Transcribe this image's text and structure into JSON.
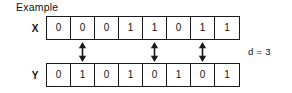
{
  "figure": {
    "caption": "Example",
    "distance_label": "d = 3",
    "rows": [
      {
        "name": "X",
        "label": "X",
        "bits": [
          "0",
          "0",
          "0",
          "1",
          "1",
          "0",
          "1",
          "1"
        ]
      },
      {
        "name": "Y",
        "label": "Y",
        "bits": [
          "0",
          "1",
          "0",
          "1",
          "0",
          "1",
          "0",
          "1"
        ]
      }
    ],
    "mismatch_indices": [
      1,
      4,
      6
    ],
    "arrow_icon": "double-headed-vertical-arrow-icon",
    "colors": {
      "stroke": "#1a1a1a",
      "text": "#111111",
      "background": "#ffffff"
    }
  },
  "chart_data": {
    "type": "table",
    "title": "Example",
    "categories": [
      "0",
      "1",
      "2",
      "3",
      "4",
      "5",
      "6",
      "7"
    ],
    "series": [
      {
        "name": "X",
        "values": [
          0,
          0,
          0,
          1,
          1,
          0,
          1,
          1
        ]
      },
      {
        "name": "Y",
        "values": [
          0,
          1,
          0,
          1,
          0,
          1,
          0,
          1
        ]
      }
    ],
    "annotations": [
      {
        "text": "d = 3",
        "meaning": "hamming-distance"
      },
      {
        "text": "mismatch",
        "positions": [
          1,
          4,
          6
        ]
      }
    ],
    "xlabel": "",
    "ylabel": "",
    "grid": true,
    "legend": "none"
  }
}
